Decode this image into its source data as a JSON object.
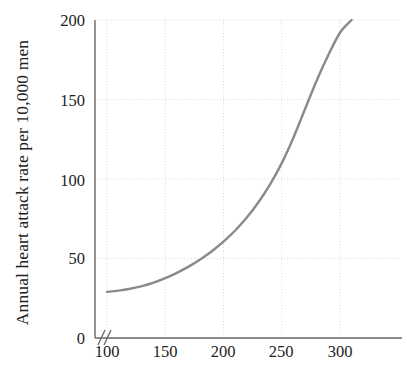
{
  "chart_data": {
    "type": "line",
    "title": "",
    "subtitle": "",
    "xlabel": "",
    "ylabel": "Annual heart attack rate per 10,000 men",
    "xlim": [
      90,
      340
    ],
    "ylim": [
      0,
      200
    ],
    "xticks": [
      100,
      150,
      200,
      250,
      300
    ],
    "yticks": [
      0,
      50,
      100,
      150,
      200
    ],
    "xtick_labels": [
      "100",
      "150",
      "200",
      "250",
      "300"
    ],
    "ytick_labels": [
      "0",
      "50",
      "100",
      "150",
      "200"
    ],
    "grid": true,
    "grid_style": "dotted",
    "legend": null,
    "axis_break": "//",
    "series": [
      {
        "name": "Annual heart attack rate",
        "color": "#8a8a8a",
        "line_width": 2.4,
        "x": [
          100,
          110,
          120,
          130,
          140,
          150,
          160,
          170,
          180,
          190,
          200,
          210,
          220,
          230,
          240,
          250,
          260,
          270,
          280,
          290,
          300,
          310
        ],
        "y": [
          29,
          29.8,
          31,
          32.6,
          34.8,
          37.6,
          41,
          44.9,
          49.4,
          54.6,
          60.6,
          67.6,
          75.8,
          85.4,
          96.6,
          110,
          126,
          144,
          162,
          178,
          192,
          200
        ]
      }
    ],
    "colors": {
      "curve": "#8a8a8a",
      "axis": "#666666",
      "grid": "#d8d8d8",
      "text": "#222222",
      "background": "#ffffff"
    }
  },
  "axes": {
    "y_title": "Annual heart attack rate per 10,000 men",
    "y_tick_0": "0",
    "y_tick_1": "50",
    "y_tick_2": "100",
    "y_tick_3": "150",
    "y_tick_4": "200",
    "x_tick_0": "100",
    "x_tick_1": "150",
    "x_tick_2": "200",
    "x_tick_3": "250",
    "x_tick_4": "300"
  }
}
